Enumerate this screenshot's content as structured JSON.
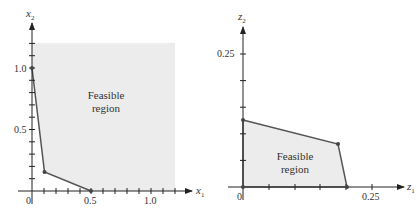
{
  "diagrams": [
    {
      "id": "left",
      "x_axis": {
        "label": "x",
        "subscript": "1",
        "ticks": [
          {
            "value": "0",
            "label": "0"
          },
          {
            "value": 0.5,
            "label": "0.5"
          },
          {
            "value": 1.0,
            "label": "1.0"
          }
        ]
      },
      "y_axis": {
        "label": "x",
        "subscript": "2",
        "ticks": [
          {
            "value": 0.5,
            "label": "0.5"
          },
          {
            "value": 1.0,
            "label": "1.0"
          }
        ]
      },
      "region_label": [
        "Feasible",
        "region"
      ],
      "vertices": [
        [
          0,
          1.0
        ],
        [
          0.1,
          0.16
        ],
        [
          0.5,
          0
        ]
      ],
      "region_type": "unbounded above/right"
    },
    {
      "id": "right",
      "x_axis": {
        "label": "z",
        "subscript": "1",
        "ticks": [
          {
            "value": "0",
            "label": "0"
          },
          {
            "value": 0.25,
            "label": "0.25"
          }
        ]
      },
      "y_axis": {
        "label": "z",
        "subscript": "2",
        "ticks": [
          {
            "value": 0.25,
            "label": "0.25"
          }
        ]
      },
      "region_label": [
        "Feasible",
        "region"
      ],
      "vertices": [
        [
          0,
          0
        ],
        [
          0,
          0.125
        ],
        [
          0.185,
          0.08
        ],
        [
          0.2,
          0
        ]
      ],
      "region_type": "bounded polygon"
    }
  ],
  "colors": {
    "region_fill": "#ececec",
    "line": "#555555",
    "axis": "#222222"
  }
}
